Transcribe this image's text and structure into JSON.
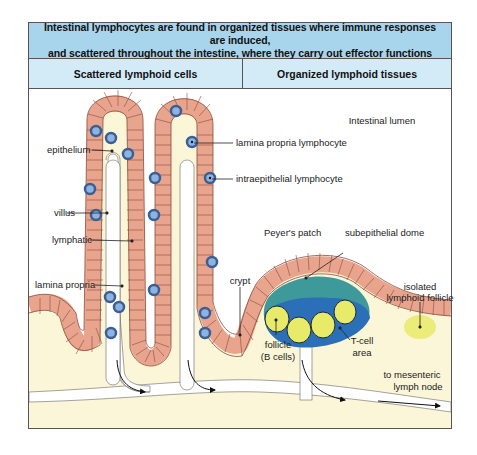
{
  "header": {
    "title_line1": "Intestinal lymphocytes are found in organized tissues where immune responses are induced,",
    "title_line2": "and scattered throughout the intestine, where they carry out effector functions"
  },
  "columns": {
    "left": "Scattered lymphoid cells",
    "right": "Organized lymphoid tissues"
  },
  "labels": {
    "intestinal_lumen": "Intestinal lumen",
    "epithelium": "epithelium",
    "villus": "villus",
    "lymphatic": "lymphatic",
    "lamina_propria": "lamina propria",
    "lamina_propria_lymphocyte": "lamina propria lymphocyte",
    "intraepithelial_lymphocyte": "intraepithelial lymphocyte",
    "crypt": "crypt",
    "peyers_patch": "Peyer's patch",
    "subepithelial_dome": "subepithelial dome",
    "isolated_follicle_1": "isolated",
    "isolated_follicle_2": "lymphoid follicle",
    "follicle_1": "follicle",
    "follicle_2": "(B cells)",
    "tcell_1": "T-cell",
    "tcell_2": "area",
    "mesenteric_1": "to mesenteric",
    "mesenteric_2": "lymph node"
  },
  "colors": {
    "title_band": "#a9d5ec",
    "sub_band": "#d3ebf7",
    "epithelium": "#e8a48c",
    "epithelium_line": "#8a4a3c",
    "lamina_propria": "#fbf6d8",
    "dome": "#3e9a9a",
    "tcell_area": "#2a6fb8",
    "follicle": "#e8ea6a",
    "lymphocyte_outer": "#3a5f95",
    "lymphocyte_inner": "#8fb3e0"
  }
}
